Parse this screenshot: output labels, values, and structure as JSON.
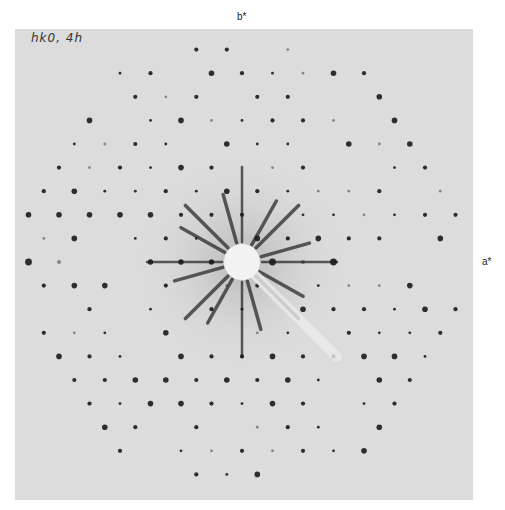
{
  "figure": {
    "type": "x-ray precession photograph",
    "annotation": "hk0, 4h",
    "axis_labels": {
      "vertical": "b*",
      "horizontal": "a*"
    },
    "film": {
      "left": 15,
      "top": 29,
      "right": 473,
      "bottom": 500,
      "color": "#dcdcdc"
    },
    "center": {
      "x": 242,
      "y": 262
    },
    "beam_stop_radius": 18,
    "lattice": {
      "col_spacing": 15.25,
      "row_spacing": 23.6,
      "radius_limit": 225,
      "spot_color": "#1a1a1a"
    },
    "streaks": {
      "count": 16,
      "color": "#2a2a2a"
    }
  }
}
